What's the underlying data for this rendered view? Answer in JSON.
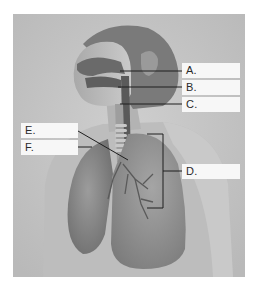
{
  "diagram": {
    "labels": [
      {
        "id": "A",
        "text": "A."
      },
      {
        "id": "B",
        "text": "B."
      },
      {
        "id": "C",
        "text": "C."
      },
      {
        "id": "D",
        "text": "D."
      },
      {
        "id": "E",
        "text": "E."
      },
      {
        "id": "F",
        "text": "F."
      }
    ]
  }
}
